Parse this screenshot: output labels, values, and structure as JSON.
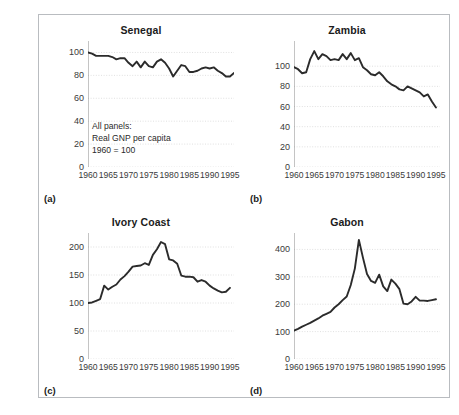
{
  "figure": {
    "annotation": "All panels:\nReal GNP per capita\n1960 = 100",
    "line_color": "#2b2b2b",
    "grid_color": "#d8d8d8",
    "axis_color": "#8a8a8a",
    "frame_color": "#b9bcc0"
  },
  "panels": [
    {
      "tag": "(a)",
      "title": "Senegal",
      "yticks": [
        "0",
        "20",
        "40",
        "60",
        "80",
        "100"
      ],
      "xticks": [
        "1960",
        "1965",
        "1970",
        "1975",
        "1980",
        "1985",
        "1990",
        "1995"
      ]
    },
    {
      "tag": "(b)",
      "title": "Zambia",
      "yticks": [
        "0",
        "20",
        "40",
        "60",
        "80",
        "100"
      ],
      "xticks": [
        "1960",
        "1965",
        "1970",
        "1975",
        "1980",
        "1985",
        "1990",
        "1995"
      ]
    },
    {
      "tag": "(c)",
      "title": "Ivory Coast",
      "yticks": [
        "0",
        "50",
        "100",
        "150",
        "200"
      ],
      "xticks": [
        "1960",
        "1965",
        "1970",
        "1975",
        "1980",
        "1985",
        "1990",
        "1995"
      ]
    },
    {
      "tag": "(d)",
      "title": "Gabon",
      "yticks": [
        "0",
        "100",
        "200",
        "300",
        "400"
      ],
      "xticks": [
        "1960",
        "1965",
        "1970",
        "1975",
        "1980",
        "1985",
        "1990",
        "1995"
      ]
    }
  ],
  "chart_data": [
    {
      "type": "line",
      "title": "Senegal",
      "panel_tag": "(a)",
      "xlabel": "",
      "ylabel": "",
      "xlim": [
        1960,
        1996
      ],
      "ylim": [
        0,
        110
      ],
      "yticks": [
        0,
        20,
        40,
        60,
        80,
        100
      ],
      "xticks": [
        1960,
        1965,
        1970,
        1975,
        1980,
        1985,
        1990,
        1995
      ],
      "grid": true,
      "annotation": "All panels: Real GNP per capita 1960 = 100",
      "x": [
        1960,
        1961,
        1962,
        1963,
        1964,
        1965,
        1966,
        1967,
        1968,
        1969,
        1970,
        1971,
        1972,
        1973,
        1974,
        1975,
        1976,
        1977,
        1978,
        1979,
        1980,
        1981,
        1982,
        1983,
        1984,
        1985,
        1986,
        1987,
        1988,
        1989,
        1990,
        1991,
        1992,
        1993,
        1994,
        1995,
        1996
      ],
      "y": [
        100,
        99,
        97,
        97,
        97,
        97,
        96,
        94,
        95,
        95,
        91,
        88,
        92,
        87,
        92,
        88,
        87,
        92,
        94,
        91,
        86,
        79,
        84,
        89,
        88,
        83,
        83,
        84,
        86,
        87,
        86,
        87,
        84,
        82,
        79,
        79,
        82
      ]
    },
    {
      "type": "line",
      "title": "Zambia",
      "panel_tag": "(b)",
      "xlabel": "",
      "ylabel": "",
      "xlim": [
        1960,
        1996
      ],
      "ylim": [
        0,
        125
      ],
      "yticks": [
        0,
        20,
        40,
        60,
        80,
        100
      ],
      "xticks": [
        1960,
        1965,
        1970,
        1975,
        1980,
        1985,
        1990,
        1995
      ],
      "grid": true,
      "x": [
        1960,
        1961,
        1962,
        1963,
        1964,
        1965,
        1966,
        1967,
        1968,
        1969,
        1970,
        1971,
        1972,
        1973,
        1974,
        1975,
        1976,
        1977,
        1978,
        1979,
        1980,
        1981,
        1982,
        1983,
        1984,
        1985,
        1986,
        1987,
        1988,
        1989,
        1990,
        1991,
        1992,
        1993,
        1994,
        1995
      ],
      "y": [
        99,
        97,
        93,
        94,
        107,
        115,
        107,
        112,
        110,
        106,
        107,
        106,
        112,
        107,
        113,
        106,
        108,
        99,
        96,
        92,
        91,
        94,
        90,
        85,
        82,
        80,
        77,
        76,
        80,
        78,
        76,
        74,
        70,
        72,
        65,
        59
      ]
    },
    {
      "type": "line",
      "title": "Ivory Coast",
      "panel_tag": "(c)",
      "xlabel": "",
      "ylabel": "",
      "xlim": [
        1960,
        1996
      ],
      "ylim": [
        0,
        225
      ],
      "yticks": [
        0,
        50,
        100,
        150,
        200
      ],
      "xticks": [
        1960,
        1965,
        1970,
        1975,
        1980,
        1985,
        1990,
        1995
      ],
      "grid": true,
      "x": [
        1960,
        1961,
        1962,
        1963,
        1964,
        1965,
        1966,
        1967,
        1968,
        1969,
        1970,
        1971,
        1972,
        1973,
        1974,
        1975,
        1976,
        1977,
        1978,
        1979,
        1980,
        1981,
        1982,
        1983,
        1984,
        1985,
        1986,
        1987,
        1988,
        1989,
        1990,
        1991,
        1992,
        1993,
        1994,
        1995
      ],
      "y": [
        100,
        101,
        104,
        107,
        131,
        124,
        129,
        133,
        142,
        148,
        156,
        165,
        166,
        167,
        171,
        168,
        186,
        196,
        209,
        205,
        178,
        176,
        170,
        149,
        147,
        147,
        146,
        138,
        141,
        138,
        131,
        126,
        122,
        119,
        120,
        127
      ]
    },
    {
      "type": "line",
      "title": "Gabon",
      "panel_tag": "(d)",
      "xlabel": "",
      "ylabel": "",
      "xlim": [
        1960,
        1996
      ],
      "ylim": [
        0,
        460
      ],
      "yticks": [
        0,
        100,
        200,
        300,
        400
      ],
      "xticks": [
        1960,
        1965,
        1970,
        1975,
        1980,
        1985,
        1990,
        1995
      ],
      "grid": true,
      "x": [
        1960,
        1961,
        1962,
        1963,
        1964,
        1965,
        1966,
        1967,
        1968,
        1969,
        1970,
        1971,
        1972,
        1973,
        1974,
        1975,
        1976,
        1977,
        1978,
        1979,
        1980,
        1981,
        1982,
        1983,
        1984,
        1985,
        1986,
        1987,
        1988,
        1989,
        1990,
        1991,
        1992,
        1993,
        1994,
        1995
      ],
      "y": [
        104,
        110,
        118,
        125,
        132,
        140,
        148,
        158,
        165,
        172,
        188,
        200,
        215,
        228,
        270,
        330,
        435,
        370,
        310,
        285,
        278,
        308,
        265,
        248,
        290,
        275,
        255,
        202,
        200,
        210,
        227,
        213,
        213,
        212,
        215,
        218
      ]
    }
  ]
}
